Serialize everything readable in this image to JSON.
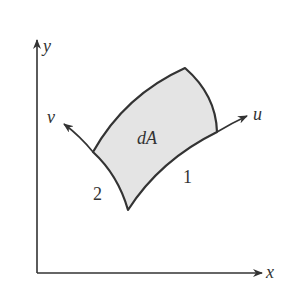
{
  "diagram": {
    "axes": {
      "x_label": "x",
      "y_label": "y"
    },
    "curves": {
      "u_label": "u",
      "v_label": "v",
      "curve_1_label": "1",
      "curve_2_label": "2"
    },
    "region": {
      "label": "dA",
      "fill": "#e6e6e6"
    },
    "colors": {
      "stroke": "#333333",
      "background": "#ffffff"
    }
  }
}
